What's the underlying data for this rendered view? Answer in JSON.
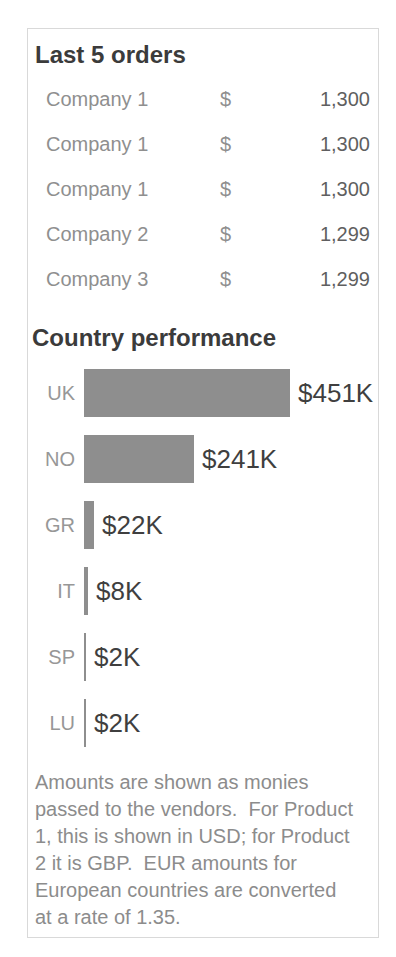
{
  "orders": {
    "title": "Last 5 orders",
    "rows": [
      {
        "company": "Company 1",
        "currency": "$",
        "amount": "1,300"
      },
      {
        "company": "Company 1",
        "currency": "$",
        "amount": "1,300"
      },
      {
        "company": "Company 1",
        "currency": "$",
        "amount": "1,300"
      },
      {
        "company": "Company 2",
        "currency": "$",
        "amount": "1,299"
      },
      {
        "company": "Company 3",
        "currency": "$",
        "amount": "1,299"
      }
    ]
  },
  "performance": {
    "title": "Country performance",
    "max_value": 451,
    "max_bar_px": 206,
    "bars": [
      {
        "label": "UK",
        "value": 451,
        "display": "$451K"
      },
      {
        "label": "NO",
        "value": 241,
        "display": "$241K"
      },
      {
        "label": "GR",
        "value": 22,
        "display": "$22K"
      },
      {
        "label": "IT",
        "value": 8,
        "display": "$8K"
      },
      {
        "label": "SP",
        "value": 2,
        "display": "$2K"
      },
      {
        "label": "LU",
        "value": 2,
        "display": "$2K"
      }
    ]
  },
  "footnote": {
    "lines": [
      "Amounts are shown as monies",
      "passed to the vendors.  For Product",
      "1, this is shown in USD; for Product",
      "2 it is GBP.  EUR amounts for",
      "European countries are converted",
      "at a rate of 1.35."
    ]
  },
  "colors": {
    "heading_text": "#3b3b3b",
    "muted_text": "#8f8f8f",
    "amount_text": "#5f5f5f",
    "bar_fill": "#8e8e8e",
    "bar_value_text": "#3f3f3f",
    "footnote_text": "#8c8c8c",
    "panel_border": "#d9d9d9",
    "background": "#ffffff"
  },
  "chart_data": [
    {
      "type": "table",
      "title": "Last 5 orders",
      "columns": [
        "Company",
        "Currency",
        "Amount"
      ],
      "rows": [
        [
          "Company 1",
          "$",
          "1,300"
        ],
        [
          "Company 1",
          "$",
          "1,300"
        ],
        [
          "Company 1",
          "$",
          "1,300"
        ],
        [
          "Company 2",
          "$",
          "1,299"
        ],
        [
          "Company 3",
          "$",
          "1,299"
        ]
      ]
    },
    {
      "type": "bar",
      "orientation": "horizontal",
      "title": "Country performance",
      "categories": [
        "UK",
        "NO",
        "GR",
        "IT",
        "SP",
        "LU"
      ],
      "values": [
        451,
        241,
        22,
        8,
        2,
        2
      ],
      "value_unit": "thousands (K)",
      "data_labels": [
        "$451K",
        "$241K",
        "$22K",
        "$8K",
        "$2K",
        "$2K"
      ],
      "xlim": [
        0,
        451
      ],
      "grid": false,
      "legend": false,
      "bar_color": "#8e8e8e"
    }
  ]
}
